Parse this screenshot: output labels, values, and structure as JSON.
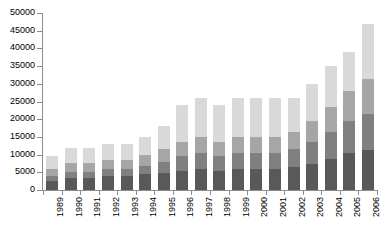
{
  "chart_data": {
    "type": "bar",
    "stacked": true,
    "title": "",
    "subtitle": "",
    "xlabel": "",
    "ylabel": "",
    "ylim": [
      0,
      50000
    ],
    "ytick_interval": 5000,
    "ytick_labels": [
      "50000",
      "45000",
      "40000",
      "35000",
      "30000",
      "25000",
      "20000",
      "15000",
      "10000",
      "5000",
      "0"
    ],
    "ytick_values": [
      50000,
      45000,
      40000,
      35000,
      30000,
      25000,
      20000,
      15000,
      10000,
      5000,
      0
    ],
    "grid": false,
    "legend": "none",
    "categories": [
      "1989",
      "1990",
      "1991",
      "1992",
      "1993",
      "1994",
      "1995",
      "1996",
      "1997",
      "1998",
      "1999",
      "2000",
      "2001",
      "2002",
      "2003",
      "2004",
      "2005",
      "2006"
    ],
    "series": [
      {
        "name": "Series 1",
        "color": "#595959",
        "values": [
          2500,
          3400,
          3400,
          3900,
          3900,
          4400,
          4900,
          5400,
          5900,
          5400,
          5900,
          5900,
          5900,
          6400,
          7400,
          8900,
          10400,
          11400
        ]
      },
      {
        "name": "Series 2",
        "color": "#808080",
        "values": [
          1400,
          1700,
          1700,
          1900,
          1900,
          2400,
          3100,
          4100,
          4600,
          4100,
          4600,
          4600,
          4600,
          5100,
          6100,
          7600,
          9100,
          10100
        ]
      },
      {
        "name": "Series 3",
        "color": "#a6a6a6",
        "values": [
          2100,
          2400,
          2400,
          2700,
          2700,
          3200,
          3500,
          4000,
          4500,
          4000,
          4500,
          4500,
          4500,
          5000,
          6000,
          7000,
          8500,
          10000
        ]
      },
      {
        "name": "Series 4",
        "color": "#d9d9d9",
        "values": [
          3500,
          4500,
          4500,
          4500,
          4500,
          5000,
          6500,
          10500,
          11000,
          10500,
          11000,
          11000,
          11000,
          9500,
          10500,
          11500,
          11000,
          15500
        ]
      }
    ],
    "totals": [
      9500,
      12000,
      12000,
      13000,
      13000,
      15000,
      18000,
      24000,
      26000,
      24000,
      26000,
      26000,
      26000,
      26000,
      30000,
      35000,
      39000,
      47000
    ]
  }
}
